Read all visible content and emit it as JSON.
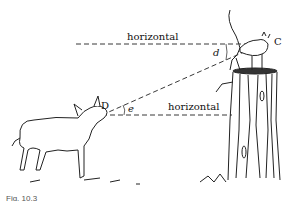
{
  "figure": {
    "labels": {
      "horizontal_top": "horizontal",
      "horizontal_bottom": "horizontal",
      "point_cat": "C",
      "point_dog": "D",
      "angle_depression": "d",
      "angle_elevation": "e"
    },
    "caption": "Fig. 10.3",
    "subjects": [
      "dog",
      "cat",
      "tree-stump"
    ]
  }
}
